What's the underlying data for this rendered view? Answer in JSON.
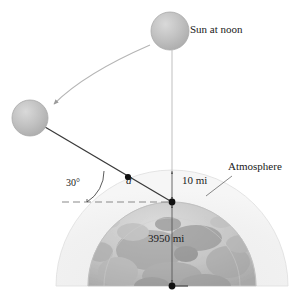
{
  "figure": {
    "labels": {
      "sun_at_noon": "Sun at noon",
      "atmosphere": "Atmosphere",
      "angle": "30°",
      "distance_d": "d",
      "atmosphere_thickness": "10 mi",
      "earth_radius": "3950 mi"
    }
  },
  "colors": {
    "background": "#ffffff",
    "sun_fill": "#bdbdbd",
    "sun_highlight": "#d6d6d6",
    "sun_stroke": "#9e9e9e",
    "atmosphere_fill": "#f2f2f2",
    "atmosphere_stroke": "#d8d8d8",
    "earth_light": "#d9d9d9",
    "earth_mid": "#b3b3b3",
    "earth_dark": "#8c8c8c",
    "ray_line": "#3a3a3a",
    "thin_line": "#b0b0b0",
    "dashed_line": "#8a8a8a",
    "text": "#1a1a1a",
    "dot": "#111111"
  },
  "geometry": {
    "earth_center": {
      "x": 172,
      "y": 286
    },
    "earth_radius_px": 84,
    "atmosphere_radius_px": 116,
    "surface_point": {
      "x": 172,
      "y": 202
    },
    "atmosphere_top_point": {
      "x": 172,
      "y": 170
    },
    "entry_point": {
      "x": 128,
      "y": 177
    },
    "angle_vertex": {
      "x": 87,
      "y": 202
    },
    "sun_noon": {
      "cx": 170,
      "cy": 31,
      "r": 19
    },
    "sun_horizon": {
      "cx": 30,
      "cy": 118,
      "r": 18
    },
    "horizon_dash_start": {
      "x": 62,
      "y": 202
    }
  },
  "elements": {
    "sun_noon_name": "sun-at-noon-circle",
    "sun_horizon_name": "sun-at-horizon-circle",
    "motion_arrow_name": "sun-motion-arrow",
    "vertical_ray_name": "noon-sunray-line",
    "slanted_ray_name": "horizon-sunray-line",
    "angle_arc_name": "angle-arc",
    "horizon_dash_name": "horizon-dashed-line",
    "atmosphere_dome_name": "atmosphere-dome",
    "earth_dome_name": "earth-dome",
    "radius_line_name": "earth-radius-line",
    "thickness_arrow_name": "atmosphere-thickness-arrow",
    "leader_line_name": "atmosphere-leader-line"
  }
}
